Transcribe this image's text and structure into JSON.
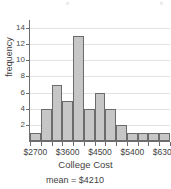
{
  "header": {
    "fragment_left": "",
    "n_left": "n",
    "fragment_right": "",
    "n_right": "n"
  },
  "caption": "mean = $4210",
  "chart_data": {
    "type": "bar",
    "title": "",
    "xlabel": "College Cost",
    "ylabel": "frequency",
    "categories": [
      "2700",
      "3000",
      "3300",
      "3600",
      "3900",
      "4200",
      "4500",
      "4800",
      "5100",
      "5400",
      "5700",
      "6000",
      "6300"
    ],
    "values": [
      1,
      4,
      7,
      5,
      13,
      4,
      6,
      4,
      2,
      1,
      1,
      1,
      1
    ],
    "bar_count": 13,
    "ylim": [
      0,
      15
    ],
    "yticks": [
      2,
      4,
      6,
      8,
      10,
      12,
      14
    ],
    "ytick_labels": [
      "2",
      "4",
      "6",
      "8",
      "10",
      "12",
      "14"
    ],
    "xtick_labels": [
      "$2700",
      "$3600",
      "$4500",
      "$5400",
      "$6300"
    ],
    "xtick_positions": [
      0,
      3,
      6,
      9,
      12
    ],
    "grid": true,
    "grid_axis": "y",
    "legend": "none",
    "bar_fill": "#c6c6c6",
    "bar_border": "#6b6b6b",
    "axis_color": "#6e6e6e",
    "grid_color": "#e2e2e2",
    "annotations": [
      "mean = $4210"
    ]
  }
}
